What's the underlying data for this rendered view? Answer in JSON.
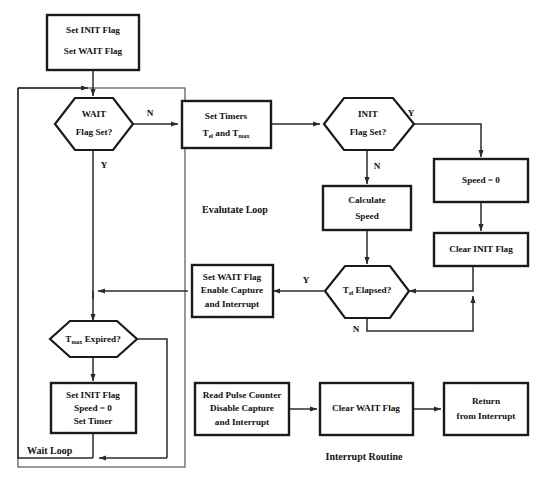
{
  "diagram": {
    "background_color": "#ffffff",
    "line_color": "#2b2b2b",
    "box_border_color": "#1a1a1a"
  },
  "group_labels": {
    "evaluate_loop": "Evalutate Loop",
    "wait_loop": "Wait Loop",
    "interrupt_routine": "Interrupt Routine"
  },
  "nodes": {
    "start_flags": {
      "type": "process",
      "line1": "Set INIT Flag",
      "line2": "Set WAIT Flag"
    },
    "wait_flag_set": {
      "type": "decision",
      "line1": "WAIT",
      "line2": "Flag Set?"
    },
    "set_timers": {
      "type": "process",
      "line1": "Set Timers",
      "line2_pre": "T",
      "line2_sub1": "el",
      "line2_mid": " and T",
      "line2_sub2": "max"
    },
    "init_flag_set": {
      "type": "decision",
      "line1": "INIT",
      "line2": "Flag Set?"
    },
    "speed_zero": {
      "type": "process",
      "line1": "Speed = 0"
    },
    "clear_init_flag": {
      "type": "process",
      "line1": "Clear INIT Flag"
    },
    "calculate_speed": {
      "type": "process",
      "line1": "Calculate",
      "line2": "Speed"
    },
    "t_el_elapsed": {
      "type": "decision",
      "pre": "T",
      "sub": "el",
      "post": "  Elapsed?"
    },
    "set_wait_flag": {
      "type": "process",
      "line1": "Set WAIT Flag",
      "line2": "Enable Capture",
      "line3": "and Interrupt"
    },
    "t_max_expired": {
      "type": "decision",
      "pre": "T",
      "sub": "max",
      "post": "  Expired?"
    },
    "reinit": {
      "type": "process",
      "line1": "Set INIT Flag",
      "line2": "Speed = 0",
      "line3": "Set Timer"
    },
    "read_pulse_counter": {
      "type": "process",
      "line1": "Read Pulse Counter",
      "line2": "Disable Capture",
      "line3": "and Interrupt"
    },
    "clear_wait_flag": {
      "type": "process",
      "line1": "Clear WAIT Flag"
    },
    "return_from_interrupt": {
      "type": "process",
      "line1": "Return",
      "line2": "from Interrupt"
    }
  },
  "edge_labels": {
    "wait_no": "N",
    "wait_yes": "Y",
    "init_yes": "Y",
    "init_no": "N",
    "tel_yes": "Y",
    "tel_no": "N"
  }
}
